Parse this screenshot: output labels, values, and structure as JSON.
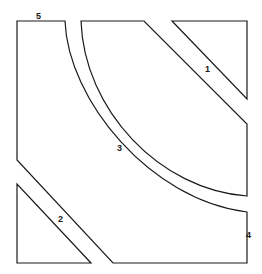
{
  "diagram": {
    "type": "pattern-pieces",
    "colors": {
      "stroke": "#1a1a1a",
      "background": "#ffffff"
    },
    "pieces": [
      {
        "id": "1",
        "label": "1",
        "shape": "triangle-corner-top-right"
      },
      {
        "id": "2",
        "label": "2",
        "shape": "triangle-corner-bottom-left"
      },
      {
        "id": "3",
        "label": "3",
        "shape": "quarter-circle-top-right"
      },
      {
        "id": "4",
        "label": "4",
        "shape": "lower-right-piece"
      },
      {
        "id": "5",
        "label": "5",
        "shape": "upper-left-piece"
      }
    ]
  }
}
